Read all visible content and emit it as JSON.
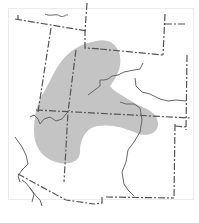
{
  "map": {
    "type": "range-map",
    "colors": {
      "background": "#ffffff",
      "frame": "#ececec",
      "range_fill": "#c4c4c4",
      "border_line": "#555555",
      "river_line": "#666666"
    },
    "legend": {
      "range_label": "Distribution range"
    }
  }
}
